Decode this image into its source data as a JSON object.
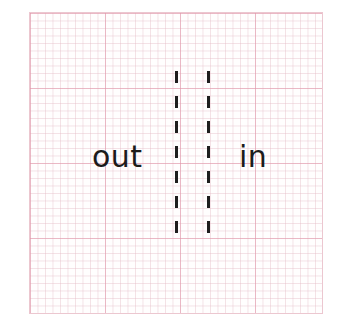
{
  "diagram": {
    "type": "boundary-illustration",
    "background": "graph-paper",
    "grid": {
      "major_color": "#e296aa",
      "minor_color": "#e6bec8"
    },
    "labels": {
      "left": "out",
      "right": "in"
    },
    "boundary": {
      "style": "double-dashed-vertical",
      "line_count": 2,
      "dash_color": "#1e1e1e"
    }
  }
}
